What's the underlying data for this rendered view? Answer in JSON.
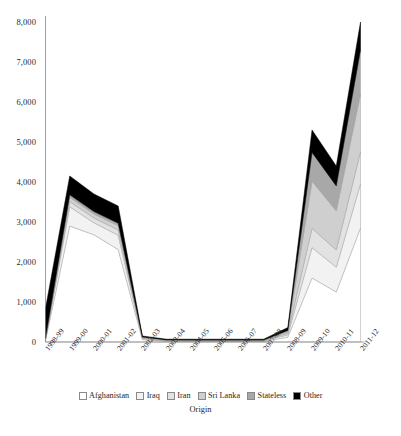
{
  "chart_data": {
    "type": "area",
    "stacked": true,
    "title": "",
    "xlabel": "Origin",
    "ylabel": "",
    "ylim": [
      0,
      8000
    ],
    "yticks": [
      0,
      1000,
      2000,
      3000,
      4000,
      5000,
      6000,
      7000,
      8000
    ],
    "ytick_labels": [
      "0",
      "1,000",
      "2,000",
      "3,000",
      "4,000",
      "5,000",
      "6,000",
      "7,000",
      "8,000"
    ],
    "grid": false,
    "legend_position": "bottom",
    "categories": [
      "1998-99",
      "1999-00",
      "2000-01",
      "2001-02",
      "2002-03",
      "2003-04",
      "2004-05",
      "2005-06",
      "2006-07",
      "2007-08",
      "2008-09",
      "2009-10",
      "2010-11",
      "2011-12"
    ],
    "series": [
      {
        "name": "Afghanistan",
        "color": "#ffffff",
        "values": [
          40,
          2900,
          2680,
          2310,
          60,
          20,
          15,
          15,
          15,
          15,
          120,
          1600,
          1250,
          2850
        ]
      },
      {
        "name": "Iraq",
        "color": "#f2f2f2",
        "values": [
          20,
          480,
          300,
          360,
          25,
          10,
          10,
          10,
          10,
          10,
          60,
          760,
          620,
          1100
        ]
      },
      {
        "name": "Iran",
        "color": "#e2e2e2",
        "values": [
          15,
          130,
          120,
          130,
          15,
          8,
          8,
          8,
          8,
          8,
          40,
          480,
          430,
          800
        ]
      },
      {
        "name": "Sri Lanka",
        "color": "#cfcfcf",
        "values": [
          15,
          110,
          100,
          110,
          15,
          8,
          8,
          8,
          8,
          8,
          40,
          1180,
          980,
          1450
        ]
      },
      {
        "name": "Stateless",
        "color": "#a8a8a8",
        "values": [
          10,
          60,
          60,
          60,
          10,
          6,
          6,
          6,
          6,
          6,
          30,
          720,
          620,
          1100
        ]
      },
      {
        "name": "Other",
        "color": "#000000",
        "values": [
          740,
          470,
          440,
          430,
          25,
          18,
          23,
          23,
          23,
          23,
          70,
          560,
          500,
          700
        ]
      }
    ],
    "totals": [
      840,
      4150,
      3700,
      3400,
      150,
      70,
      70,
      70,
      70,
      70,
      360,
      5300,
      4400,
      8000
    ]
  },
  "legend": {
    "items": [
      {
        "label": "Afghanistan"
      },
      {
        "label": "Iraq"
      },
      {
        "label": "Iran"
      },
      {
        "label": "Sri Lanka"
      },
      {
        "label": "Stateless"
      },
      {
        "label": "Other"
      }
    ]
  }
}
